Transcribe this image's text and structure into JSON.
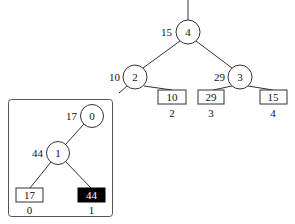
{
  "main_tree": {
    "root": {
      "id": "4",
      "weight": "15"
    },
    "internal": [
      {
        "id": "2",
        "weight": "10"
      },
      {
        "id": "3",
        "weight": "29"
      }
    ],
    "leaves": [
      {
        "value": "10",
        "index": "2"
      },
      {
        "value": "29",
        "index": "3"
      },
      {
        "value": "15",
        "index": "4"
      }
    ]
  },
  "inset_tree": {
    "root": {
      "id": "0",
      "weight": "17"
    },
    "internal": [
      {
        "id": "1",
        "weight": "44"
      }
    ],
    "leaves": [
      {
        "value": "17",
        "index": "0",
        "highlighted": false
      },
      {
        "value": "44",
        "index": "1",
        "highlighted": true
      }
    ]
  },
  "colors": {
    "stroke": "#333333",
    "highlight_fill": "#000000",
    "highlight_text": "#ffffff"
  }
}
